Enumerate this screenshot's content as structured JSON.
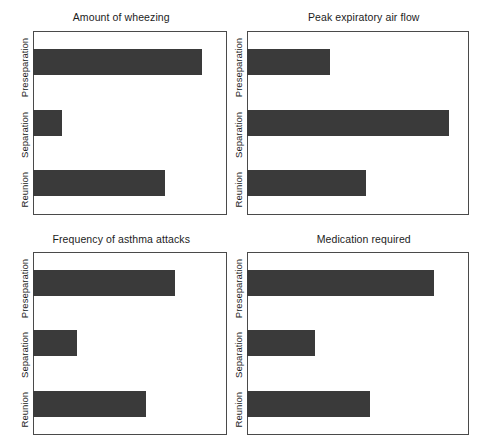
{
  "figure": {
    "background_color": "#ffffff",
    "bar_color": "#3a3a3a",
    "frame_color": "#4a4a4a"
  },
  "categories": [
    "Preseparation",
    "Separation",
    "Reunion"
  ],
  "chart_data": [
    {
      "type": "bar",
      "title": "Amount of wheezing",
      "orientation": "horizontal",
      "categories": [
        "Preseparation",
        "Separation",
        "Reunion"
      ],
      "values": [
        88,
        15,
        69
      ],
      "xlabel": "",
      "ylabel": "",
      "xlim": [
        0,
        100
      ],
      "grid": false,
      "legend": "none"
    },
    {
      "type": "bar",
      "title": "Peak expiratory air flow",
      "orientation": "horizontal",
      "categories": [
        "Preseparation",
        "Separation",
        "Reunion"
      ],
      "values": [
        38,
        92,
        54
      ],
      "xlabel": "",
      "ylabel": "",
      "xlim": [
        0,
        100
      ],
      "grid": false,
      "legend": "none"
    },
    {
      "type": "bar",
      "title": "Frequency of asthma attacks",
      "orientation": "horizontal",
      "categories": [
        "Preseparation",
        "Separation",
        "Reunion"
      ],
      "values": [
        74,
        23,
        59
      ],
      "xlabel": "",
      "ylabel": "",
      "xlim": [
        0,
        100
      ],
      "grid": false,
      "legend": "none"
    },
    {
      "type": "bar",
      "title": "Medication required",
      "orientation": "horizontal",
      "categories": [
        "Preseparation",
        "Separation",
        "Reunion"
      ],
      "values": [
        85,
        31,
        56
      ],
      "xlabel": "",
      "ylabel": "",
      "xlim": [
        0,
        100
      ],
      "grid": false,
      "legend": "none"
    }
  ],
  "panels": [
    {
      "title": "Amount of wheezing",
      "labels": [
        "Preseparation",
        "Separation",
        "Reunion"
      ],
      "values": [
        88,
        15,
        69
      ]
    },
    {
      "title": "Peak expiratory air flow",
      "labels": [
        "Preseparation",
        "Separation",
        "Reunion"
      ],
      "values": [
        38,
        92,
        54
      ]
    },
    {
      "title": "Frequency of asthma attacks",
      "labels": [
        "Preseparation",
        "Separation",
        "Reunion"
      ],
      "values": [
        74,
        23,
        59
      ]
    },
    {
      "title": "Medication required",
      "labels": [
        "Preseparation",
        "Separation",
        "Reunion"
      ],
      "values": [
        85,
        31,
        56
      ]
    }
  ]
}
